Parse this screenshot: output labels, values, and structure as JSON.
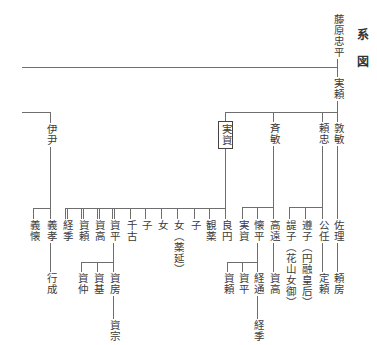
{
  "title": {
    "char1": "系",
    "char2": "図"
  },
  "people": {
    "tadahira": "藤原忠平",
    "saneyori": "実頼",
    "koretada": "伊尹",
    "sanesuke_adopted": "実資",
    "tadatoshi": "斉敏",
    "yoritada": "頼忠",
    "atsutoshi": "敦敏",
    "yoshichika": "義懐",
    "yoshitaka": "義孝",
    "tsunesue_adopted": "経季",
    "sukeyori_adopted": "資頼",
    "suketaka_adopted": "資高",
    "sukehira_adopted": "資平",
    "chifuru": "千古",
    "child_1": "子",
    "daughter_1": "女",
    "daughter_2": "女（薬延）",
    "child_2": "子",
    "kanyaku": "観薬",
    "ryoen": "良円",
    "sanesuke": "実資",
    "kanehira": "懐平",
    "takato": "高遠",
    "shishi": "諟子（花山女御）",
    "junshi": "遵子（円融皇后）",
    "kinto": "公任",
    "sukemasa": "佐理",
    "yukinari": "行成",
    "sukenaka": "資仲",
    "sukemoto": "資基",
    "sukefusa": "資房",
    "sukeyori": "資頼",
    "sukehira": "資平",
    "tsunemichi": "経通",
    "suketaka": "資高",
    "sadayori": "定頼",
    "yorifusa": "頼房",
    "sukemune": "資宗",
    "tsunesue": "経季"
  }
}
